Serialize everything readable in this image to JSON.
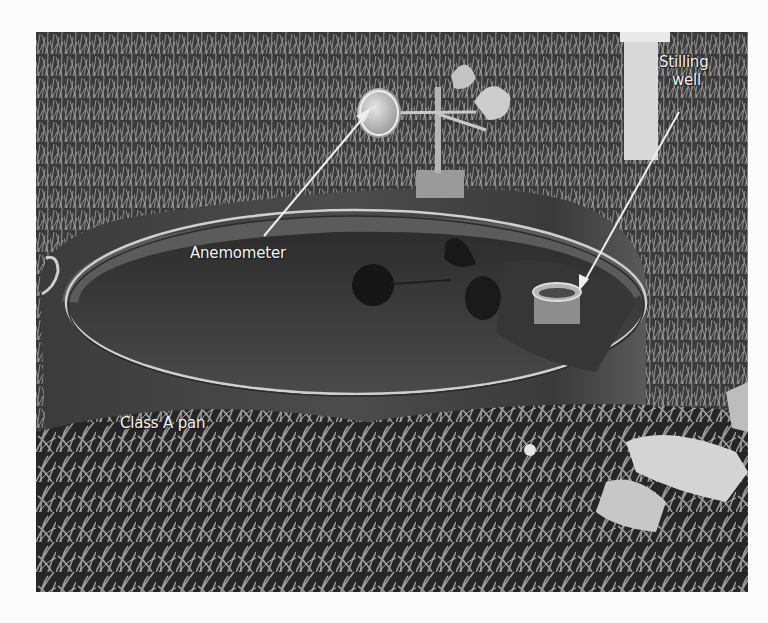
{
  "figure": {
    "labels": [
      {
        "id": "anemometer",
        "text": "Anemometer"
      },
      {
        "id": "stilling_well_line1",
        "text": "Stilling"
      },
      {
        "id": "stilling_well_line2",
        "text": "well"
      },
      {
        "id": "class_a_pan",
        "text": "Class A pan"
      }
    ]
  },
  "colors": {
    "page_background": "#fbfbfb",
    "label_text": "#f4f4f4",
    "arrow": "#eeeeee"
  }
}
